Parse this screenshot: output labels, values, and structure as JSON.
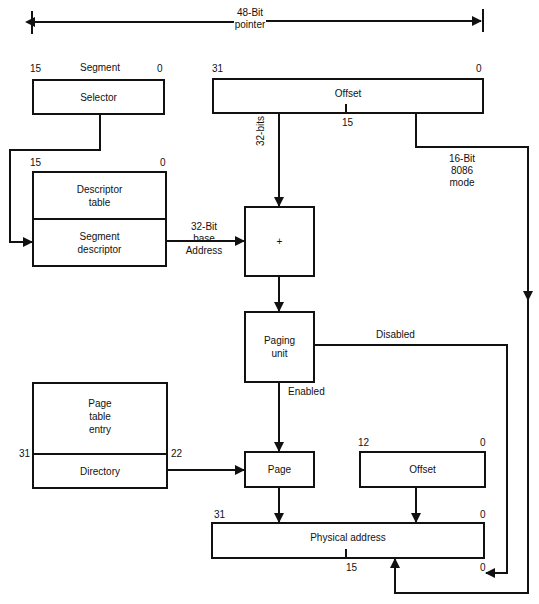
{
  "pointer": {
    "line1": "48-Bit",
    "line2": "pointer"
  },
  "segment": {
    "title": "Segment",
    "bit_high": "15",
    "bit_low": "0",
    "selector_label": "Selector"
  },
  "offset_top": {
    "bit_high": "31",
    "bit_low": "0",
    "label": "Offset",
    "mid_bit": "15"
  },
  "descriptor": {
    "bit_high": "15",
    "bit_low": "0",
    "table_line1": "Descriptor",
    "table_line2": "table",
    "seg_line1": "Segment",
    "seg_line2": "descriptor"
  },
  "base_address": {
    "line1": "32-Bit",
    "line2": "base",
    "line3": "Address"
  },
  "bits32_label": "32-bits",
  "adder": {
    "label": "+"
  },
  "mode16": {
    "line1": "16-Bit",
    "line2": "8086",
    "line3": "mode"
  },
  "paging_unit": {
    "line1": "Paging",
    "line2": "unit",
    "disabled": "Disabled",
    "enabled": "Enabled"
  },
  "page_table": {
    "line1": "Page",
    "line2": "table",
    "line3": "entry",
    "directory": "Directory",
    "bit_left": "31",
    "bit_right": "22"
  },
  "page_box": {
    "label": "Page"
  },
  "offset_low": {
    "label": "Offset",
    "bit_high": "12",
    "bit_low": "0"
  },
  "physical": {
    "label": "Physical address",
    "bit_high": "31",
    "bit_low_top": "0",
    "mid_bit": "15",
    "bit_low_bottom": "0"
  }
}
